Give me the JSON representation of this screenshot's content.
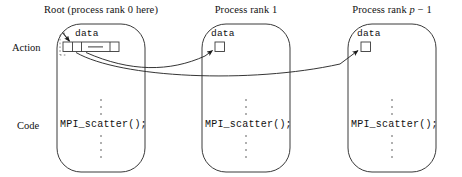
{
  "figure": {
    "title_row_labels": {
      "action": "Action",
      "code": "Code"
    },
    "columns": [
      {
        "id": "root",
        "title": "Root (process rank 0 here)",
        "data_label": "data",
        "code": "MPI_scatter();",
        "buffer_kind": "array",
        "buffer_cells": 3,
        "buffer_middle_glyph": "—"
      },
      {
        "id": "rank1",
        "title": "Process rank 1",
        "data_label": "data",
        "code": "MPI_scatter();",
        "buffer_kind": "single-cell",
        "buffer_cells": 1,
        "buffer_middle_glyph": ""
      },
      {
        "id": "rankp1",
        "title_prefix": "Process rank ",
        "title_italic_var": "p",
        "title_suffix": " − 1",
        "title": "Process rank p − 1",
        "data_label": "data",
        "code": "MPI_scatter();",
        "buffer_kind": "single-cell",
        "buffer_cells": 1,
        "buffer_middle_glyph": ""
      }
    ],
    "vertical_ellipsis": "⋮",
    "arrows": [
      {
        "from": "root-buffer",
        "to": "rank1-buffer",
        "style": "curved"
      },
      {
        "from": "root-buffer",
        "to": "rankp1-buffer",
        "style": "curved"
      }
    ],
    "colors": {
      "stroke": "#3a3a3a",
      "text": "#111111",
      "background": "#ffffff",
      "arrow_fill": "#1a1a1a"
    }
  }
}
